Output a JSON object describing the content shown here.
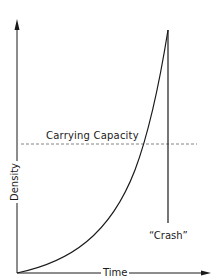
{
  "diagram": {
    "axes": {
      "x_label": "Time",
      "y_label": "Density"
    },
    "annotations": {
      "carrying_capacity": "Carrying Capacity",
      "crash": "“Crash”"
    },
    "colors": {
      "curve": "#1a1a1a",
      "axis": "#1a1a1a",
      "carrying_capacity_line": "#777777",
      "background": "#ffffff"
    },
    "elements": {
      "growth_curve": "exponential rise from origin to peak above carrying capacity",
      "drop_line": "vertical line from peak straight down, labeled Crash",
      "carrying_capacity_line": "horizontal dashed line"
    }
  }
}
